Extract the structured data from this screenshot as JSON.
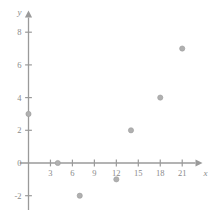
{
  "chart_data": {
    "type": "scatter",
    "title": "",
    "subtitle": "",
    "xlabel": "x",
    "ylabel": "y",
    "xlim": [
      -1.2,
      23.5
    ],
    "ylim": [
      -3.2,
      9.2
    ],
    "xticks": [
      3,
      6,
      9,
      12,
      15,
      18,
      21
    ],
    "yticks": [
      -2,
      0,
      2,
      4,
      6,
      8
    ],
    "xtick_labels": [
      "3",
      "6",
      "9",
      "12",
      "15",
      "18",
      "21"
    ],
    "ytick_labels": [
      "-2",
      "0",
      "2",
      "4",
      "6",
      "8"
    ],
    "grid": false,
    "legend": null,
    "axis_style": "cartesian-arrows",
    "points": [
      {
        "x": 0,
        "y": 3
      },
      {
        "x": 4,
        "y": 0
      },
      {
        "x": 7,
        "y": -2
      },
      {
        "x": 12,
        "y": -1
      },
      {
        "x": 14,
        "y": 2
      },
      {
        "x": 18,
        "y": 4
      },
      {
        "x": 21,
        "y": 7
      }
    ],
    "series": [
      {
        "name": "data",
        "x": [
          0,
          4,
          7,
          12,
          14,
          18,
          21
        ],
        "values": [
          3,
          0,
          -2,
          -1,
          2,
          4,
          7
        ]
      }
    ],
    "colors": {
      "axis": "#9a9a9a",
      "marker": "#b0b0b0",
      "marker_edge": "#9c9c9c",
      "tick_label": "#8a8a8a",
      "background": "#ffffff"
    },
    "marker": {
      "shape": "circle",
      "radius": 2.6
    }
  }
}
